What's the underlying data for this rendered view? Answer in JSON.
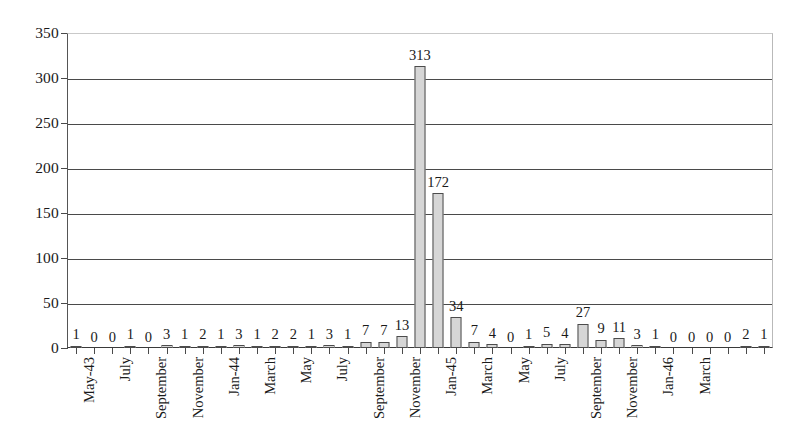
{
  "chart_data": {
    "type": "bar",
    "title": "",
    "subtitle": "",
    "xlabel": "",
    "ylabel": "",
    "ylim": [
      0,
      350
    ],
    "ytick_step": 50,
    "yticks": [
      0,
      50,
      100,
      150,
      200,
      250,
      300,
      350
    ],
    "grid": true,
    "legend": false,
    "legend_position": "none",
    "bar_fill_color": "#d6d6d6",
    "bar_border_color": "#4c4c4c",
    "value_labels_shown": true,
    "categories": [
      "May-43",
      "June",
      "July",
      "August",
      "September",
      "October",
      "November",
      "December",
      "Jan-44",
      "February",
      "March",
      "April",
      "May",
      "June",
      "July",
      "August",
      "September",
      "October",
      "November",
      "December",
      "Jan-45",
      "February",
      "March",
      "April",
      "May",
      "June",
      "July",
      "August",
      "September",
      "October",
      "November",
      "December",
      "Jan-46",
      "February",
      "March"
    ],
    "values": [
      1,
      0,
      0,
      1,
      0,
      3,
      1,
      2,
      1,
      3,
      1,
      2,
      2,
      1,
      3,
      1,
      7,
      7,
      13,
      313,
      172,
      34,
      7,
      4,
      0,
      1,
      5,
      4,
      27,
      9,
      11,
      3,
      1,
      0,
      0
    ],
    "tail_values": [
      0,
      0,
      2,
      1
    ],
    "tick_labels_visible": [
      "May-43",
      "July",
      "September",
      "November",
      "Jan-44",
      "March",
      "May",
      "July",
      "September",
      "November",
      "Jan-45",
      "March",
      "May",
      "July",
      "September",
      "November",
      "Jan-46",
      "March"
    ],
    "tick_label_interval": 2,
    "max_value": 313,
    "second_max_value": 172
  }
}
